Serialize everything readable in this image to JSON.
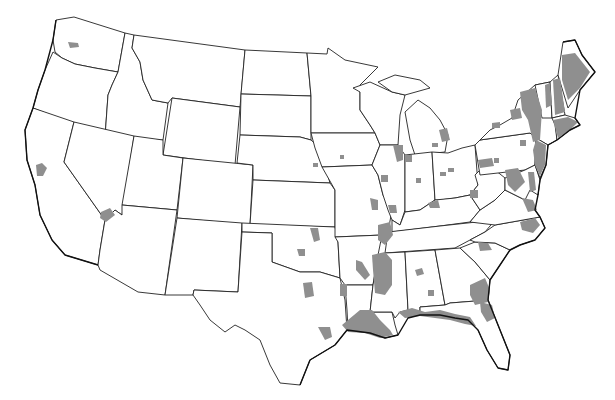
{
  "map": {
    "type": "choropleth",
    "region": "Contiguous United States",
    "background_color": "#ffffff",
    "boundary_color": "#222222",
    "shade_color": "#8f8f8f",
    "shaded_areas": [
      "Puget Sound, Washington",
      "San Francisco Bay Area, California",
      "Lower Colorado River, Arizona/California/Nevada",
      "Northern and central Oklahoma",
      "North-central Texas",
      "Southeast Texas Gulf Coast",
      "Louisiana Gulf Coast",
      "Mississippi River Delta (Arkansas/Mississippi/Louisiana)",
      "Mississippi/Alabama/Florida Gulf Coast",
      "Coastal Georgia and northeast Florida",
      "Upstate South Carolina",
      "Central Alabama",
      "Eastern Virginia / Chesapeake",
      "Northeastern North Carolina",
      "Ohio River valley",
      "Central Illinois / Indiana / Ohio scattered counties",
      "Southeastern Michigan",
      "Iowa / Missouri scattered counties",
      "Eastern New York / Hudson Valley",
      "New Jersey",
      "Eastern Pennsylvania / Maryland / Delaware",
      "Vermont / New Hampshire / Maine",
      "Massachusetts / Connecticut / Rhode Island"
    ]
  }
}
